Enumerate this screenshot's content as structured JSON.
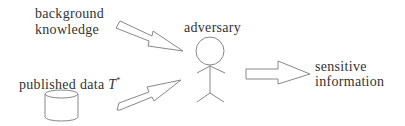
{
  "labels": {
    "background_line1": "background",
    "background_line2": "knowledge",
    "published": "published data ",
    "published_symbol": "T",
    "published_sup": "*",
    "adversary": "adversary",
    "sensitive_line1": "sensitive",
    "sensitive_line2": "information"
  },
  "colors": {
    "stroke": "#888888",
    "text": "#333333"
  }
}
